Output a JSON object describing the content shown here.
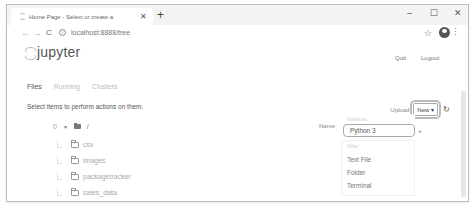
{
  "browser": {
    "tab_title": "Home Page - Select or create a",
    "tab_close": "✕",
    "new_tab": "+",
    "window_controls": {
      "minimize": "–",
      "maximize": "☐",
      "close": "✕"
    },
    "back": "←",
    "forward": "→",
    "reload": "C",
    "info_icon": "i",
    "url": "localhost:8888/tree",
    "star": "☆",
    "menu": "⋮"
  },
  "header": {
    "logo_text": "jupyter",
    "quit_label": "Quit",
    "logout_label": "Logout"
  },
  "tabs": [
    {
      "label": "Files",
      "active": true
    },
    {
      "label": "Running",
      "active": false
    },
    {
      "label": "Clusters",
      "active": false
    }
  ],
  "main": {
    "select_message": "Select items to perform actions on them.",
    "upload_label": "Upload",
    "new_label": "New ▾",
    "refresh": "↻",
    "selected_count": "0",
    "caret": "▼",
    "path": "/",
    "name_sort_label": "Name ↓"
  },
  "files": [
    {
      "name": "csv"
    },
    {
      "name": "images"
    },
    {
      "name": "packagetracker"
    },
    {
      "name": "sales_data"
    }
  ],
  "new_menu": {
    "notebook_header": "Notebook:",
    "notebook_items": [
      "Python 3"
    ],
    "other_header": "Other:",
    "other_items": [
      "Text File",
      "Folder",
      "Terminal"
    ],
    "submenu_arrow": "▸"
  }
}
